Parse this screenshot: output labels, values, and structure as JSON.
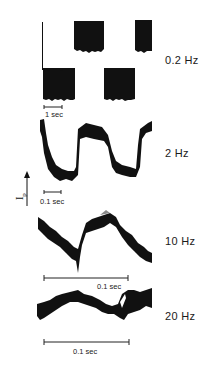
{
  "figure": {
    "y_axis_label": "Ip",
    "y_axis_label_main": "I",
    "y_axis_label_sub": "p",
    "panels": [
      {
        "frequency": "0.2 Hz",
        "scale_bar": "1 sec",
        "waveform": "square"
      },
      {
        "frequency": "2 Hz",
        "scale_bar": "0.1 sec",
        "waveform": "rounded-square"
      },
      {
        "frequency": "10 Hz",
        "scale_bar": "0.1 sec",
        "waveform": "triangular-ish"
      },
      {
        "frequency": "20 Hz",
        "scale_bar": "0.1 sec",
        "waveform": "noisy-sinusoid"
      }
    ]
  },
  "colors": {
    "trace": "#111111",
    "background": "#ffffff"
  }
}
